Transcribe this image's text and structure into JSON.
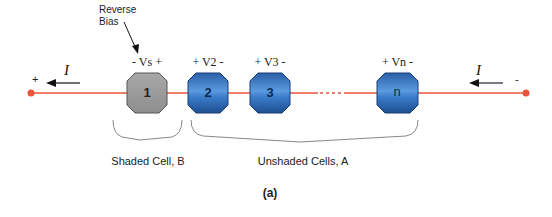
{
  "diagram": {
    "annotation": {
      "line1": "Reverse",
      "line2": "Bias"
    },
    "terminals": {
      "left": "+",
      "right": "-"
    },
    "current": {
      "left": "I",
      "right": "I"
    },
    "cells": [
      {
        "id": "1",
        "label": "- Vs +",
        "type": "shaded",
        "color": "#9e9e9e"
      },
      {
        "id": "2",
        "label": "+ V2 -",
        "type": "unshaded",
        "color": "#2f6fb8"
      },
      {
        "id": "3",
        "label": "+ V3 -",
        "type": "unshaded",
        "color": "#2f6fb8"
      },
      {
        "id": "n",
        "label": "+ Vn -",
        "type": "unshaded",
        "color": "#2f6fb8"
      }
    ],
    "ellipsis": "....",
    "groups": {
      "shaded": "Shaded Cell, B",
      "unshaded": "Unshaded Cells, A"
    },
    "caption": "(a)",
    "colors": {
      "wire": "#e8563a",
      "terminal": "#e8563a",
      "arrow": "#111111"
    }
  }
}
